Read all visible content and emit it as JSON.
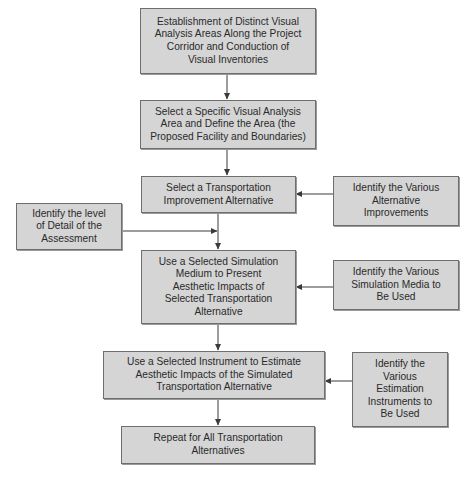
{
  "diagram": {
    "type": "flowchart",
    "main_steps": [
      {
        "id": "step1",
        "label": "Establishment of Distinct Visual\nAnalysis Areas Along the Project\nCorridor and Conduction of\nVisual Inventories"
      },
      {
        "id": "step2",
        "label": "Select a Specific Visual Analysis\nArea and Define the Area (the\nProposed Facility and Boundaries)"
      },
      {
        "id": "step3",
        "label": "Select a Transportation\nImprovement Alternative"
      },
      {
        "id": "step4",
        "label": "Use a Selected Simulation\nMedium to Present\nAesthetic Impacts of\nSelected Transportation\nAlternative"
      },
      {
        "id": "step5",
        "label": "Use a Selected Instrument to Estimate\nAesthetic Impacts of the Simulated\nTransportation Alternative"
      },
      {
        "id": "step6",
        "label": "Repeat for All Transportation\nAlternatives"
      }
    ],
    "side_inputs": [
      {
        "id": "inputA",
        "label": "Identify the Various\nAlternative\nImprovements",
        "feeds": "step3"
      },
      {
        "id": "inputB",
        "label": "Identify the level\nof Detail of the\nAssessment",
        "feeds": "step3-step4-connector"
      },
      {
        "id": "inputC",
        "label": "Identify the Various\nSimulation Media to\nBe Used",
        "feeds": "step4"
      },
      {
        "id": "inputD",
        "label": "Identify the\nVarious\nEstimation\nInstruments to\nBe Used",
        "feeds": "step5"
      }
    ],
    "colors": {
      "box_fill": "#d5d5d5",
      "box_border": "#6e6e6e",
      "line": "#3a3a3a",
      "text": "#2a2a2a"
    }
  }
}
